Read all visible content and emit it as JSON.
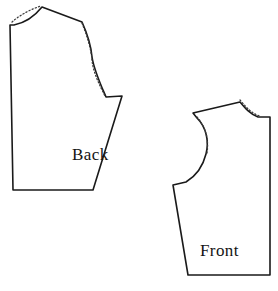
{
  "diagram": {
    "background_color": "#ffffff",
    "line_color": "#1a1a1a",
    "alteration_line_color": "#3a3a3a",
    "canvas": {
      "width": 278,
      "height": 291
    }
  },
  "pieces": [
    {
      "id": "back",
      "label": "Back",
      "label_x": 72,
      "label_y": 160,
      "outline_path": "M 10 25 L 14 25 C 24 23 34 17 42 7 L 82 22 C 87 33 91 45 92 57 C 94 70 100 83 106 97 L 122 96 L 93 190 L 13 190 Z",
      "alteration_paths": [
        "M 12 22 C 20 15 31 9 41 6",
        "M 82 23 C 87 36 91 48 92 60 C 93 72 99 84 105 96"
      ]
    },
    {
      "id": "front",
      "label": "Front",
      "label_x": 200,
      "label_y": 256,
      "outline_path": "M 193 113 L 240 102 C 245 108 250 114 258 117 L 270 117 L 270 275 L 188 275 L 173 185 L 186 182 C 196 176 203 166 206 154 C 209 142 207 128 197 118 Z",
      "alteration_paths": [
        "M 240 100 C 246 107 252 114 260 116",
        "M 197 117 C 206 127 209 141 207 153"
      ]
    }
  ],
  "labels": {
    "back": "Back",
    "front": "Front"
  }
}
